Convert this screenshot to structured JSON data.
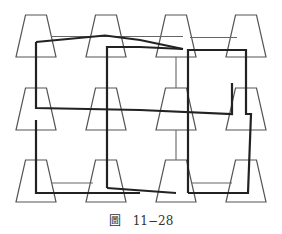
{
  "caption": {
    "figure_char": "圖",
    "number": "11−28"
  },
  "colors": {
    "trapezoid_stroke": "#555555",
    "thin_line": "#666666",
    "thick_line": "#222222",
    "background": "#ffffff"
  },
  "grid": {
    "rows": 3,
    "columns": 4,
    "column_centers": [
      36,
      106,
      176,
      246
    ],
    "row_tops": [
      15,
      87,
      160
    ],
    "trapezoid": {
      "top_width": 21,
      "bottom_width": 40,
      "height": 42
    }
  }
}
